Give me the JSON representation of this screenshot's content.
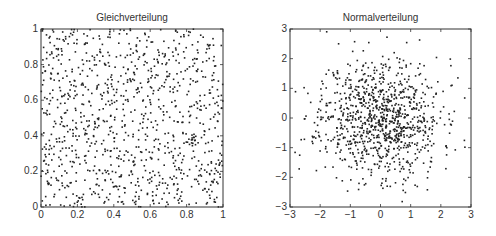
{
  "chart_data": [
    {
      "type": "scatter",
      "title": "Gleichverteilung",
      "xlabel": "",
      "ylabel": "",
      "xlim": [
        0,
        1
      ],
      "ylim": [
        0,
        1
      ],
      "xticks": [
        "0",
        "0.2",
        "0.4",
        "0.6",
        "0.8",
        "1"
      ],
      "yticks": [
        "0",
        "0.2",
        "0.4",
        "0.6",
        "0.8",
        "1"
      ],
      "grid": false,
      "legend": null,
      "distribution": "uniform",
      "n_points": 1000,
      "seed": 7,
      "marker_color": "#222222"
    },
    {
      "type": "scatter",
      "title": "Normalverteilung",
      "xlabel": "",
      "ylabel": "",
      "xlim": [
        -3,
        3
      ],
      "ylim": [
        -3,
        3
      ],
      "xticks": [
        "-3",
        "-2",
        "-1",
        "0",
        "1",
        "2",
        "3"
      ],
      "yticks": [
        "-3",
        "-2",
        "-1",
        "0",
        "1",
        "2",
        "3"
      ],
      "grid": false,
      "legend": null,
      "distribution": "normal",
      "mean": [
        0,
        0
      ],
      "std": [
        1,
        1
      ],
      "n_points": 1000,
      "seed": 11,
      "marker_color": "#222222"
    }
  ]
}
